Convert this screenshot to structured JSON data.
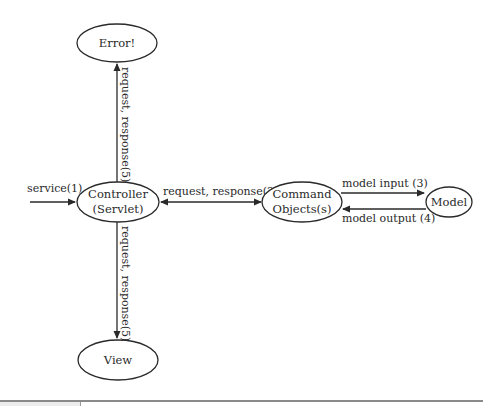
{
  "diagram": {
    "nodes": [
      {
        "id": "error",
        "lines": [
          "Error!"
        ]
      },
      {
        "id": "controller",
        "lines": [
          "Controller",
          "(Servlet)"
        ]
      },
      {
        "id": "command",
        "lines": [
          "Command",
          "Objects(s)"
        ]
      },
      {
        "id": "model",
        "lines": [
          "Model"
        ]
      },
      {
        "id": "view",
        "lines": [
          "View"
        ]
      }
    ],
    "edges": [
      {
        "from": "external",
        "to": "controller",
        "label": "service(1)",
        "direction": "one-way"
      },
      {
        "from": "controller",
        "to": "command",
        "label": "request, response(2)",
        "direction": "two-way"
      },
      {
        "from": "command",
        "to": "model",
        "label": "model input (3)",
        "direction": "one-way"
      },
      {
        "from": "model",
        "to": "command",
        "label": "model output (4)",
        "direction": "one-way"
      },
      {
        "from": "controller",
        "to": "error",
        "label": "request, response(5)",
        "direction": "one-way"
      },
      {
        "from": "controller",
        "to": "view",
        "label": "request, response(5)",
        "direction": "one-way"
      }
    ]
  }
}
